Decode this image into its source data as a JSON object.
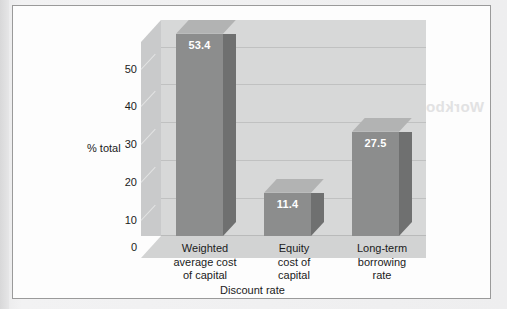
{
  "chart_data": {
    "type": "bar",
    "title": "",
    "subtitle": "",
    "xlabel": "Discount rate",
    "ylabel": "% total",
    "categories": [
      "Weighted\naverage cost\nof capital",
      "Equity\ncost of\ncapital",
      "Long-term\nborrowing\nrate"
    ],
    "category_lines": [
      [
        "Weighted",
        "average cost",
        "of capital"
      ],
      [
        "Equity",
        "cost of",
        "capital"
      ],
      [
        "Long-term",
        "borrowing",
        "rate"
      ]
    ],
    "values": [
      53.4,
      11.4,
      27.5
    ],
    "value_labels": [
      "53.4",
      "11.4",
      "27.5"
    ],
    "ylim": [
      0,
      57
    ],
    "yticks": [
      0,
      10,
      20,
      30,
      40,
      50
    ],
    "ytick_labels": [
      "0",
      "10",
      "20",
      "30",
      "40",
      "50"
    ],
    "grid": true,
    "grid_axis": "y",
    "legend": false,
    "legend_position": "none",
    "three_d": true
  },
  "axis": {
    "y_title": "% total",
    "x_title": "Discount rate"
  },
  "colors": {
    "bar_front": "#8c8d8d",
    "bar_side": "#6f7070",
    "bar_top": "#b2b3b3",
    "back_wall": "#d7d8d8",
    "side_wall": "#c9cacb",
    "floor": "#d2d3d3",
    "gridline": "#c0c1c1",
    "card_background": "#fdfdfd",
    "card_border": "#9a9a9a",
    "page_background": "#ececed",
    "value_text": "#ffffff",
    "axis_text": "#1b1b1b"
  },
  "artifacts": {
    "bleed_text_1": "Workbook",
    "bleed_text_2": "Work"
  }
}
